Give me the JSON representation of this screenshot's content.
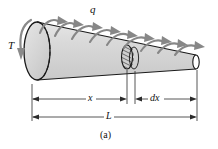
{
  "figure": {
    "caption": "(a)",
    "labels": {
      "distributed_torque": "q",
      "applied_torque": "T",
      "position": "x",
      "element_length": "dx",
      "total_length": "L"
    },
    "colors": {
      "body_fill": "#d4d4d4",
      "body_fill_light": "#e2e2e2",
      "outline": "#1a1a1a",
      "arrow_gray": "#868686",
      "arrow_gray_dark": "#6f6f6f",
      "dimension_line": "#2b2b2b",
      "background": "#ffffff",
      "end_face_white": "#ffffff"
    },
    "geometry": {
      "left_end_center_x": 37,
      "left_end_center_y": 51,
      "left_end_rx": 13,
      "left_end_ry": 29,
      "cut_center_x": 127,
      "cut_center_y": 57,
      "cut_rx": 5.5,
      "cut_ry": 12,
      "right_end_center_x": 196,
      "right_end_center_y": 62,
      "right_end_rx": 3.2,
      "right_end_ry": 7,
      "dim_x_line_y": 99,
      "dim_L_line_y": 117,
      "dim_left_x": 32,
      "dim_x_right_x": 127,
      "dim_dx_left_x": 135,
      "dim_right_x": 197
    }
  },
  "elements": {
    "body": "tapered-circular-shaft",
    "arrows_distributed": 9,
    "torque_arrow": "curved-torque-arrow-T",
    "hidden_edges": "dashed-ellipse-back-faces",
    "hatching": "section-cut-hatching"
  }
}
